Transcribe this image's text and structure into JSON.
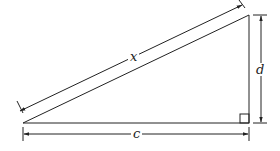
{
  "diagram": {
    "type": "right-triangle",
    "labels": {
      "hypotenuse": "x",
      "height": "d",
      "base": "c"
    },
    "right_angle_marker": true,
    "colors": {
      "stroke": "#222222",
      "background": "#ffffff"
    }
  }
}
